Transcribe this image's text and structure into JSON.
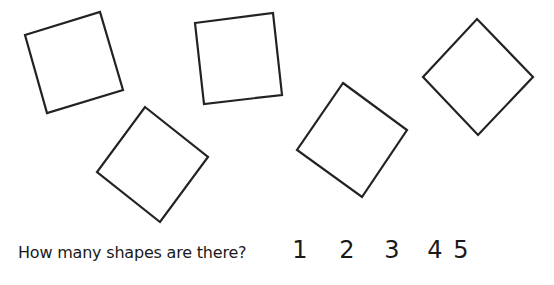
{
  "shapes": [
    {
      "name": "square-1",
      "points": "25,35 100,12 123,90 47,113"
    },
    {
      "name": "square-2",
      "points": "195,23 273,13 282,95 204,104"
    },
    {
      "name": "square-3",
      "points": "145,107 208,157 160,222 97,172"
    },
    {
      "name": "square-4",
      "points": "343,83 407,130 362,197 297,150"
    },
    {
      "name": "square-5",
      "points": "477,19 533,77 478,135 423,77"
    }
  ],
  "question": "How many shapes are there?",
  "answers": [
    "1",
    "2",
    "3",
    "4",
    "5"
  ],
  "colors": {
    "stroke": "#222222",
    "background": "#ffffff"
  }
}
